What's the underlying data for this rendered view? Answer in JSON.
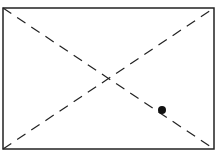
{
  "diagram": {
    "type": "rectangle-with-diagonals",
    "rectangle": {
      "x1": 3,
      "y1": 8,
      "x2": 214,
      "y2": 149
    },
    "diagonals": [
      {
        "name": "top-left-to-bottom-right",
        "style": "dashed"
      },
      {
        "name": "bottom-left-to-top-right",
        "style": "dashed"
      }
    ],
    "point": {
      "x": 162,
      "y": 110,
      "on": "top-left-to-bottom-right diagonal"
    },
    "colors": {
      "stroke": "#222222",
      "point": "#111111",
      "background": "#ffffff"
    }
  }
}
